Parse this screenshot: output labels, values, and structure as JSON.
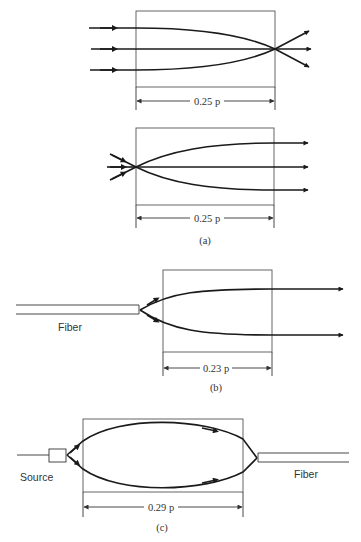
{
  "figure": {
    "panels": [
      {
        "id": "a-top",
        "description": "Parallel rays focused to a point at the exit face of a GRIN lens",
        "dimension_label": "0.25 p"
      },
      {
        "id": "a-bottom",
        "description": "Point source at entry face collimated by GRIN lens",
        "dimension_label": "0.25 p",
        "caption": "(a)"
      },
      {
        "id": "b",
        "description": "Fiber output expanded and collimated by GRIN lens",
        "dimension_label": "0.23 p",
        "fiber_label": "Fiber",
        "caption": "(b)"
      },
      {
        "id": "c",
        "description": "Source coupled into fiber through GRIN lens",
        "dimension_label": "0.29 p",
        "source_label": "Source",
        "fiber_label": "Fiber",
        "caption": "(c)"
      }
    ]
  },
  "colors": {
    "ray": "#1a1a1a",
    "box": "#555555",
    "text": "#333333",
    "background": "#ffffff"
  }
}
